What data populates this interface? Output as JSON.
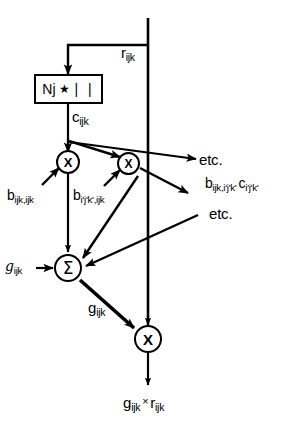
{
  "figure": {
    "background_color": "#ffffff",
    "line_color": "#000000",
    "width": 299,
    "height": 427
  },
  "nodes": {
    "norm_box": {
      "name": "Nj * | |",
      "coefficient": "N",
      "coefficient_sub": "j",
      "operator": "★",
      "bars": "|  |"
    },
    "mult_left": {
      "glyph": "X",
      "label": "multiply"
    },
    "mult_mid": {
      "glyph": "X",
      "label": "multiply"
    },
    "sum": {
      "glyph": "Σ",
      "label": "summation"
    },
    "mult_out": {
      "glyph": "X",
      "label": "multiply"
    }
  },
  "labels": {
    "r_input": {
      "base": "r",
      "sub": "ijk"
    },
    "c_ijk": {
      "base": "c",
      "sub": "ijk"
    },
    "b_ijk_ijk": {
      "base": "b",
      "sub": "ijk,ijk"
    },
    "b_ipjpkp_ijk": {
      "base": "b",
      "sub": "i'j'k',ijk"
    },
    "etc_upper": {
      "text": "etc."
    },
    "etc_lower": {
      "text": "etc."
    },
    "b_c_term": {
      "base1": "b",
      "sub1": "ijk,i'j'k'",
      "base2": "c",
      "sub2": "i'j'k'"
    },
    "script_g_input": {
      "base": "g",
      "sub": "ijk",
      "style": "script"
    },
    "g_out": {
      "base": "g",
      "sub": "ijk"
    },
    "result": {
      "base1": "g",
      "sub1": "ijk",
      "op": "×",
      "base2": "r",
      "sub2": "ijk"
    }
  }
}
